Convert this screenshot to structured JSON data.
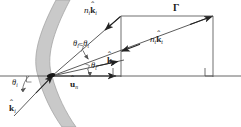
{
  "figure": {
    "width": 241,
    "height": 127,
    "background": "#ffffff",
    "stroke_color": "#3a3a3a",
    "interface_fill": "#c9c9c9",
    "interface_stroke": "#9a9a9a"
  },
  "labels": {
    "incident_vector": {
      "n": "n",
      "n_sub": "i",
      "k": "k",
      "k_sub": "i",
      "hat": "ˆ",
      "text": "n_i k̂_i"
    },
    "transmitted_vector": {
      "n": "n",
      "n_sub": "t",
      "k": "k",
      "k_sub": "t",
      "hat": "ˆ",
      "text": "n_t k̂_t"
    },
    "gamma": "Γ",
    "angle_difference": {
      "theta_i": "θ",
      "sub_i": "i",
      "minus": "−",
      "theta_t": "θ",
      "sub_t": "t",
      "text": "θ_i − θ_t"
    },
    "k_hat_t": {
      "k": "k",
      "sub": "t",
      "hat": "ˆ",
      "text": "k̂_t"
    },
    "k_hat_i": {
      "k": "k",
      "sub": "i",
      "hat": "ˆ",
      "text": "k̂_i"
    },
    "u_hat_n": {
      "u": "u",
      "sub": "n",
      "hat": "ˆ",
      "text": "û_n"
    },
    "theta_t": {
      "theta": "θ",
      "sub": "t",
      "text": "θ_t"
    },
    "theta_i": {
      "theta": "θ",
      "sub": "i",
      "text": "θ_i"
    }
  },
  "geometry": {
    "optical_axis_y": 76,
    "interface_vertex_x": 52,
    "gamma_line": {
      "x1": 121,
      "y1": 16,
      "x2": 213,
      "y2": 16
    },
    "left_vertical": {
      "x": 121,
      "y1": 16,
      "y2": 77
    },
    "right_vertical": {
      "x": 213,
      "y1": 16,
      "y2": 77
    },
    "right_angle_marks": 2
  }
}
